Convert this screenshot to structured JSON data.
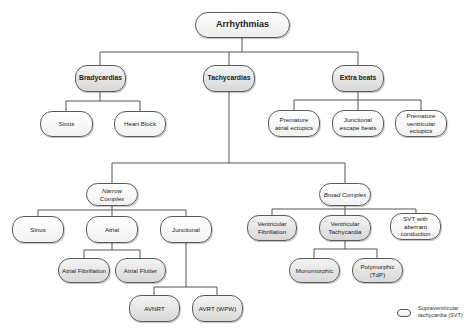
{
  "diagram": {
    "title": "Arrhythmias",
    "level1": [
      {
        "label": "Bradycardias"
      },
      {
        "label": "Tachycardias"
      },
      {
        "label": "Extra beats"
      }
    ],
    "bradycardias_children": [
      {
        "label": "Sinus"
      },
      {
        "label": "Heart Block"
      }
    ],
    "extra_beats_children": [
      {
        "label": "Premature atrial ectopics"
      },
      {
        "label": "Junctional escape beats"
      },
      {
        "label": "Premature ventricular ectopics"
      }
    ],
    "tachycardias_children": [
      {
        "label": "Narrow Complex"
      },
      {
        "label": "Broad Complex"
      }
    ],
    "narrow_children": [
      {
        "label": "Sinus"
      },
      {
        "label": "Atrial"
      },
      {
        "label": "Junctional"
      }
    ],
    "atrial_children": [
      {
        "label": "Atrial Fibrillation"
      },
      {
        "label": "Atrial Flutter"
      }
    ],
    "junctional_children": [
      {
        "label": "AVNRT"
      },
      {
        "label": "AVRT (WPW)"
      }
    ],
    "broad_children": [
      {
        "label": "Ventricular Fibrillation"
      },
      {
        "label": "Ventricular Tachycardia"
      },
      {
        "label": "SVT with aberrant conduction"
      }
    ],
    "vt_children": [
      {
        "label": "Monomorphic"
      },
      {
        "label": "Polymorphic (TdP)"
      }
    ],
    "legend": {
      "label": "Supraventricular tachycardia (SVT)"
    }
  },
  "colors": {
    "border": "#5a5a5a",
    "white_node": "#ffffff",
    "grey_node": "#d8d8d8",
    "connector": "#555555"
  }
}
